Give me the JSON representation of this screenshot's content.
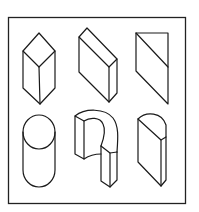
{
  "figure": {
    "frame_color": "#222222",
    "line_color": "#1a1a1a",
    "background": "#ffffff",
    "shapes": [
      {
        "id": "shape-1",
        "name": "square-prism",
        "row": 1,
        "col": 1
      },
      {
        "id": "shape-2",
        "name": "rectangular-slab",
        "row": 1,
        "col": 2
      },
      {
        "id": "shape-3",
        "name": "parallelogram-plane",
        "row": 1,
        "col": 3
      },
      {
        "id": "shape-4",
        "name": "cylinder",
        "row": 2,
        "col": 1
      },
      {
        "id": "shape-5",
        "name": "half-ring-arch",
        "row": 2,
        "col": 2
      },
      {
        "id": "shape-6",
        "name": "half-cylinder-slab",
        "row": 2,
        "col": 3
      }
    ]
  }
}
